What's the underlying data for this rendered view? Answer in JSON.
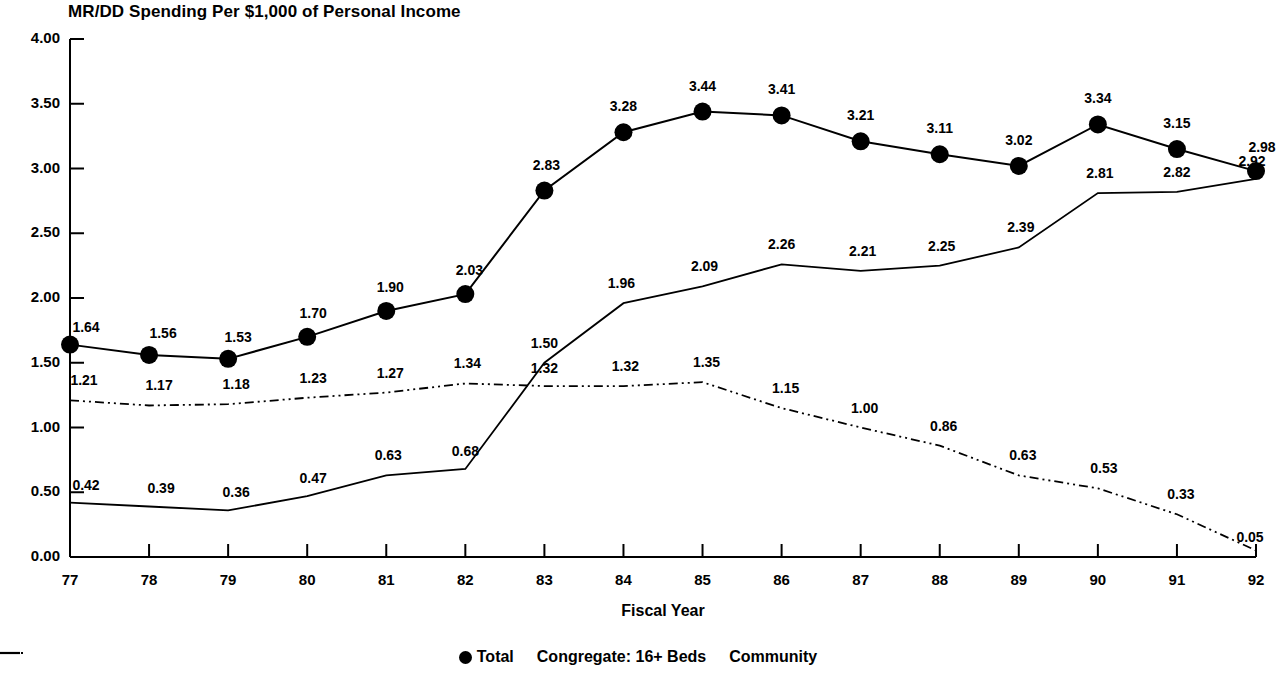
{
  "chart_data": {
    "type": "line",
    "title": "MR/DD Spending Per $1,000 of Personal Income",
    "xlabel": "Fiscal Year",
    "ylabel": "",
    "grid": false,
    "legend_position": "bottom",
    "ylim": [
      0.0,
      4.0
    ],
    "ytick_labels": [
      "0.00",
      "0.50",
      "1.00",
      "1.50",
      "2.00",
      "2.50",
      "3.00",
      "3.50",
      "4.00"
    ],
    "ytick_values": [
      0.0,
      0.5,
      1.0,
      1.5,
      2.0,
      2.5,
      3.0,
      3.5,
      4.0
    ],
    "categories": [
      "77",
      "78",
      "79",
      "80",
      "81",
      "82",
      "83",
      "84",
      "85",
      "86",
      "87",
      "88",
      "89",
      "90",
      "91",
      "92"
    ],
    "series": [
      {
        "name": "Total",
        "marker": "filled-circle",
        "line_style": "solid",
        "values": [
          1.64,
          1.56,
          1.53,
          1.7,
          1.9,
          2.03,
          2.83,
          3.28,
          3.44,
          3.41,
          3.21,
          3.11,
          3.02,
          3.34,
          3.15,
          2.98
        ],
        "labels": [
          "1.64",
          "1.56",
          "1.53",
          "1.70",
          "1.90",
          "2.03",
          "2.83",
          "3.28",
          "3.44",
          "3.41",
          "3.21",
          "3.11",
          "3.02",
          "3.34",
          "3.15",
          "2.98"
        ]
      },
      {
        "name": "Congregate: 16+ Beds",
        "marker": "none",
        "line_style": "dash-dot",
        "values": [
          1.21,
          1.17,
          1.18,
          1.23,
          1.27,
          1.34,
          1.32,
          1.32,
          1.35,
          1.15,
          1.0,
          0.86,
          0.63,
          0.53,
          0.33,
          0.05
        ],
        "labels": [
          "1.21",
          "1.17",
          "1.18",
          "1.23",
          "1.27",
          "1.34",
          "1.32",
          "1.32",
          "1.35",
          "1.15",
          "1.00",
          "0.86",
          "0.63",
          "0.53",
          "0.33",
          "0.05"
        ]
      },
      {
        "name": "Community",
        "marker": "none",
        "line_style": "solid",
        "values": [
          0.42,
          0.39,
          0.36,
          0.47,
          0.63,
          0.68,
          1.5,
          1.96,
          2.09,
          2.26,
          2.21,
          2.25,
          2.39,
          2.81,
          2.82,
          2.92
        ],
        "labels": [
          "0.42",
          "0.39",
          "0.36",
          "0.47",
          "0.63",
          "0.68",
          "1.50",
          "1.96",
          "2.09",
          "2.26",
          "2.21",
          "2.25",
          "2.39",
          "2.81",
          "2.82",
          "2.92"
        ]
      }
    ],
    "colors": {
      "ink": "#000000",
      "background": "#ffffff"
    }
  },
  "legend": {
    "items": [
      {
        "label": "Total",
        "marker": "filled-circle"
      },
      {
        "label": "Congregate: 16+ Beds",
        "marker": "dash-dot-line"
      },
      {
        "label": "Community",
        "marker": "solid-line"
      }
    ]
  }
}
